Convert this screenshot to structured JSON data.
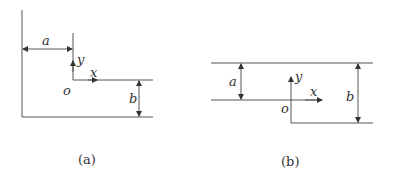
{
  "figure": {
    "panels": [
      {
        "id": "a",
        "caption": "(a)",
        "labels": {
          "dim1": "a",
          "dim2": "b",
          "axis_x": "x",
          "axis_y": "y",
          "origin": "o"
        }
      },
      {
        "id": "b",
        "caption": "(b)",
        "labels": {
          "dim1": "a",
          "dim2": "b",
          "axis_x": "x",
          "axis_y": "y",
          "origin": "o"
        }
      }
    ],
    "line_color": "#555555",
    "text_color": "#333333"
  }
}
